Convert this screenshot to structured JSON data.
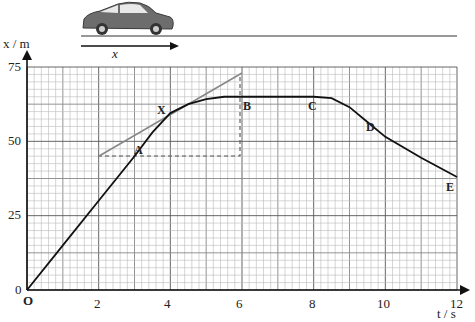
{
  "illustration": {
    "car": "car-icon",
    "direction_label": "x"
  },
  "chart_data": {
    "type": "line",
    "title": "",
    "xlabel": "t / s",
    "ylabel": "x / m",
    "x_ticks": [
      2,
      4,
      6,
      8,
      10,
      12
    ],
    "y_ticks": [
      0,
      25,
      50,
      75
    ],
    "origin_label": "O",
    "xlim": [
      0,
      12
    ],
    "ylim": [
      0,
      75
    ],
    "grid": true,
    "grid_minor": {
      "x_step": 0.2,
      "y_step": 2.5
    },
    "series": [
      {
        "name": "displacement",
        "x": [
          0,
          1,
          2,
          3,
          3.5,
          4,
          4.5,
          5,
          5.5,
          6,
          7,
          8,
          8.5,
          9,
          9.5,
          10,
          11,
          12
        ],
        "y": [
          0,
          15,
          30,
          45,
          53,
          59.5,
          62.5,
          64.2,
          65,
          65,
          65,
          65,
          64.5,
          61.5,
          56.5,
          51.5,
          44.5,
          38
        ]
      }
    ],
    "tangent": {
      "x": [
        2,
        6
      ],
      "y": [
        45,
        73
      ]
    },
    "construction_lines": {
      "horizontal": {
        "x": [
          2,
          6
        ],
        "y": 45
      },
      "vertical": {
        "x": 6,
        "y": [
          45,
          73
        ]
      }
    },
    "annotations": [
      {
        "label": "A",
        "x": 3.0,
        "y": 45
      },
      {
        "label": "X",
        "x": 3.8,
        "y": 60
      },
      {
        "label": "B",
        "x": 6.2,
        "y": 65
      },
      {
        "label": "C",
        "x": 8.0,
        "y": 65
      },
      {
        "label": "D",
        "x": 9.5,
        "y": 55
      },
      {
        "label": "E",
        "x": 11.8,
        "y": 38
      }
    ]
  },
  "labels": {
    "y_axis": "x / m",
    "x_axis": "t / s",
    "y0": "0",
    "y25": "25",
    "y50": "50",
    "y75": "75",
    "x2": "2",
    "x4": "4",
    "x6": "6",
    "x8": "8",
    "x10": "10",
    "x12": "12",
    "origin": "O",
    "A": "A",
    "X": "X",
    "B": "B",
    "C": "C",
    "D": "D",
    "E": "E"
  }
}
